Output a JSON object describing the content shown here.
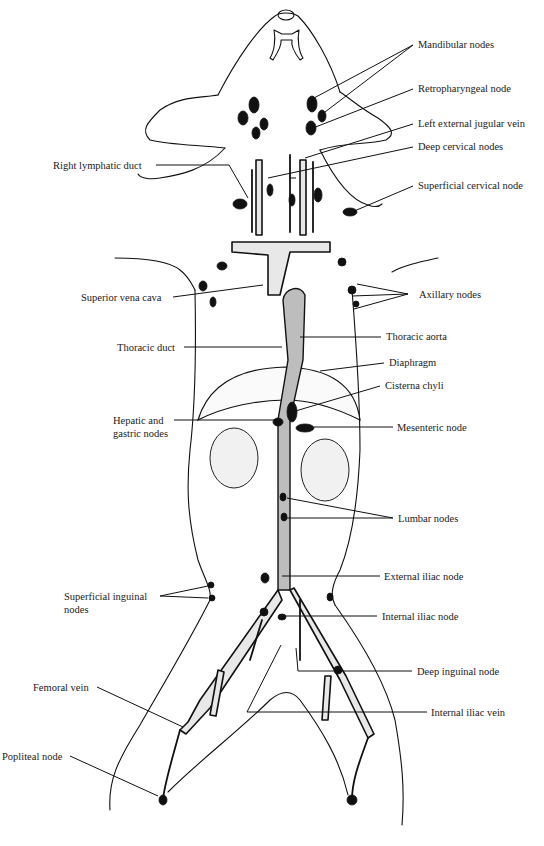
{
  "figure": {
    "colors": {
      "ink": "#111111",
      "background": "#ffffff",
      "shading": "#e8e8e8"
    }
  },
  "labels": {
    "right": [
      {
        "id": "mandibular-nodes",
        "text": "Mandibular nodes"
      },
      {
        "id": "retropharyngeal-node",
        "text": "Retropharyngeal node"
      },
      {
        "id": "left-external-jugular-vein",
        "text": "Left external jugular vein"
      },
      {
        "id": "deep-cervical-nodes",
        "text": "Deep cervical nodes"
      },
      {
        "id": "superficial-cervical-node",
        "text": "Superficial cervical node"
      },
      {
        "id": "axillary-nodes",
        "text": "Axillary nodes"
      },
      {
        "id": "thoracic-aorta",
        "text": "Thoracic aorta"
      },
      {
        "id": "diaphragm",
        "text": "Diaphragm"
      },
      {
        "id": "cisterna-chyli",
        "text": "Cisterna chyli"
      },
      {
        "id": "mesenteric-node",
        "text": "Mesenteric node"
      },
      {
        "id": "lumbar-nodes",
        "text": "Lumbar nodes"
      },
      {
        "id": "external-iliac-node",
        "text": "External iliac node"
      },
      {
        "id": "internal-iliac-node",
        "text": "Internal iliac node"
      },
      {
        "id": "deep-inguinal-node",
        "text": "Deep inguinal node"
      },
      {
        "id": "internal-iliac-vein",
        "text": "Internal iliac vein"
      }
    ],
    "left": [
      {
        "id": "right-lymphatic-duct",
        "text": "Right lymphatic duct"
      },
      {
        "id": "superior-vena-cava",
        "text": "Superior vena cava"
      },
      {
        "id": "thoracic-duct",
        "text": "Thoracic duct"
      },
      {
        "id": "hepatic-and-gastric-nodes",
        "text": "Hepatic and gastric nodes"
      },
      {
        "id": "superficial-inguinal-nodes",
        "text": "Superficial inguinal nodes"
      },
      {
        "id": "femoral-vein",
        "text": "Femoral vein"
      },
      {
        "id": "popliteal-node",
        "text": "Popliteal node"
      }
    ]
  }
}
